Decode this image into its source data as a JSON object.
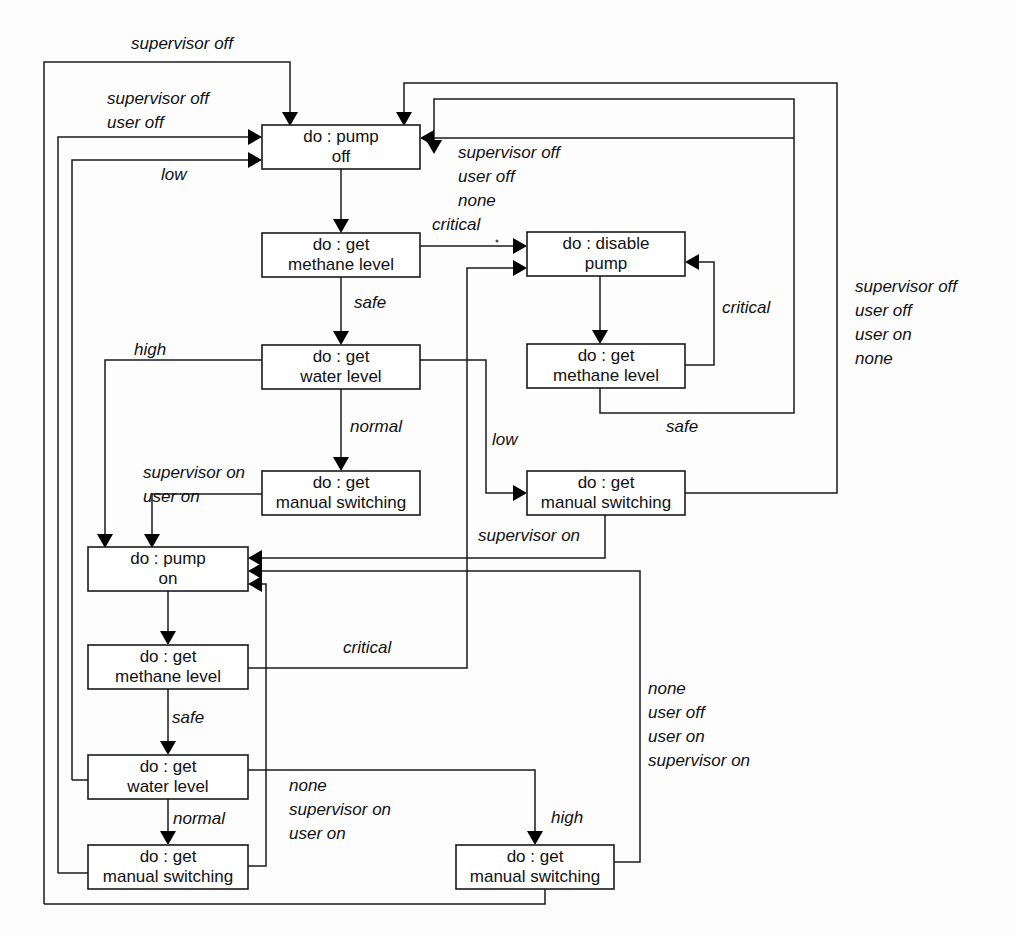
{
  "diagram": {
    "type": "state-machine-diagram",
    "colors": {
      "background": "#fdfdfd",
      "stroke": "#1a1a1a",
      "text": "#111111"
    },
    "states": [
      {
        "id": "pump-off",
        "line1": "do : pump",
        "line2": "off",
        "x": 262,
        "y": 125,
        "w": 158,
        "h": 44
      },
      {
        "id": "methane-off",
        "line1": "do : get",
        "line2": "methane level",
        "x": 262,
        "y": 233,
        "w": 158,
        "h": 44
      },
      {
        "id": "water-off",
        "line1": "do : get",
        "line2": "water level",
        "x": 262,
        "y": 345,
        "w": 158,
        "h": 44
      },
      {
        "id": "manual-off",
        "line1": "do : get",
        "line2": "manual switching",
        "x": 262,
        "y": 471,
        "w": 158,
        "h": 44
      },
      {
        "id": "disable-pump",
        "line1": "do : disable",
        "line2": "pump",
        "x": 527,
        "y": 232,
        "w": 158,
        "h": 44
      },
      {
        "id": "methane-disable",
        "line1": "do : get",
        "line2": "methane level",
        "x": 527,
        "y": 344,
        "w": 158,
        "h": 44
      },
      {
        "id": "manual-low",
        "line1": "do : get",
        "line2": "manual switching",
        "x": 527,
        "y": 471,
        "w": 158,
        "h": 44
      },
      {
        "id": "pump-on",
        "line1": "do : pump",
        "line2": "on",
        "x": 88,
        "y": 547,
        "w": 160,
        "h": 44
      },
      {
        "id": "methane-on",
        "line1": "do : get",
        "line2": "methane level",
        "x": 88,
        "y": 645,
        "w": 160,
        "h": 44
      },
      {
        "id": "water-on",
        "line1": "do : get",
        "line2": "water level",
        "x": 88,
        "y": 755,
        "w": 160,
        "h": 44
      },
      {
        "id": "manual-on",
        "line1": "do : get",
        "line2": "manual switching",
        "x": 88,
        "y": 845,
        "w": 160,
        "h": 44
      },
      {
        "id": "manual-high",
        "line1": "do : get",
        "line2": "manual switching",
        "x": 456,
        "y": 845,
        "w": 158,
        "h": 44
      }
    ],
    "edge_labels": [
      {
        "id": "supervisor-off-top",
        "text": "supervisor off",
        "x": 131,
        "y": 45
      },
      {
        "id": "supervisor-off-2",
        "text": "supervisor off",
        "x": 107,
        "y": 100
      },
      {
        "id": "user-off-2",
        "text": "user off",
        "x": 107,
        "y": 124
      },
      {
        "id": "low-to-off",
        "text": "low",
        "x": 161,
        "y": 176
      },
      {
        "id": "critical-off",
        "text": "critical",
        "x": 432,
        "y": 226
      },
      {
        "id": "supervisor-off-3",
        "text": "supervisor off",
        "x": 458,
        "y": 154
      },
      {
        "id": "user-off-3",
        "text": "user off",
        "x": 458,
        "y": 178
      },
      {
        "id": "none-3",
        "text": "none",
        "x": 458,
        "y": 202
      },
      {
        "id": "safe-off",
        "text": "safe",
        "x": 354,
        "y": 304
      },
      {
        "id": "critical-disable",
        "text": "critical",
        "x": 722,
        "y": 309
      },
      {
        "id": "safe-disable",
        "text": "safe",
        "x": 666,
        "y": 428
      },
      {
        "id": "high-off",
        "text": "high",
        "x": 134,
        "y": 351
      },
      {
        "id": "normal-off",
        "text": "normal",
        "x": 350,
        "y": 428
      },
      {
        "id": "low-right",
        "text": "low",
        "x": 492,
        "y": 441
      },
      {
        "id": "supervisor-on-2",
        "text": "supervisor on",
        "x": 143,
        "y": 474
      },
      {
        "id": "user-on-2",
        "text": "user on",
        "x": 143,
        "y": 498
      },
      {
        "id": "supervisor-on-mid",
        "text": "supervisor on",
        "x": 478,
        "y": 537
      },
      {
        "id": "supervisor-off-right",
        "text": "supervisor off",
        "x": 855,
        "y": 288
      },
      {
        "id": "user-off-right",
        "text": "user off",
        "x": 855,
        "y": 312
      },
      {
        "id": "user-on-right",
        "text": "user on",
        "x": 855,
        "y": 336
      },
      {
        "id": "none-right",
        "text": "none",
        "x": 855,
        "y": 360
      },
      {
        "id": "critical-on",
        "text": "critical",
        "x": 343,
        "y": 649
      },
      {
        "id": "safe-on",
        "text": "safe",
        "x": 172,
        "y": 719
      },
      {
        "id": "normal-on",
        "text": "normal",
        "x": 173,
        "y": 820
      },
      {
        "id": "none-bottom",
        "text": "none",
        "x": 289,
        "y": 787
      },
      {
        "id": "supervisor-on-bottom",
        "text": "supervisor on",
        "x": 289,
        "y": 811
      },
      {
        "id": "user-on-bottom",
        "text": "user on",
        "x": 289,
        "y": 835
      },
      {
        "id": "none-br",
        "text": "none",
        "x": 648,
        "y": 690
      },
      {
        "id": "user-off-br",
        "text": "user off",
        "x": 648,
        "y": 714
      },
      {
        "id": "user-on-br",
        "text": "user on",
        "x": 648,
        "y": 738
      },
      {
        "id": "supervisor-on-br",
        "text": "supervisor on",
        "x": 648,
        "y": 762
      },
      {
        "id": "high-br",
        "text": "high",
        "x": 551,
        "y": 819
      }
    ],
    "transitions": [
      {
        "id": "t-supervisor-off-top",
        "from": "pump-on",
        "to": "pump-off",
        "label": "supervisor off"
      },
      {
        "id": "t-supervisor-off-user-off",
        "from": "manual-on",
        "to": "pump-off",
        "label": "supervisor off / user off"
      },
      {
        "id": "t-low",
        "from": "water-on",
        "to": "pump-off",
        "label": "low"
      },
      {
        "id": "t-off-methane",
        "from": "pump-off",
        "to": "methane-off",
        "label": ""
      },
      {
        "id": "t-critical-off",
        "from": "methane-off",
        "to": "disable-pump",
        "label": "critical"
      },
      {
        "id": "t-safe-off",
        "from": "methane-off",
        "to": "water-off",
        "label": "safe"
      },
      {
        "id": "t-high-off",
        "from": "water-off",
        "to": "pump-on",
        "label": "high"
      },
      {
        "id": "t-normal-off",
        "from": "water-off",
        "to": "manual-off",
        "label": "normal"
      },
      {
        "id": "t-supervisor-on-user-on",
        "from": "manual-off",
        "to": "pump-on",
        "label": "supervisor on / user on"
      },
      {
        "id": "t-disable-methane",
        "from": "disable-pump",
        "to": "methane-disable",
        "label": ""
      },
      {
        "id": "t-critical-disable",
        "from": "methane-disable",
        "to": "disable-pump",
        "label": "critical"
      },
      {
        "id": "t-safe-disable",
        "from": "methane-disable",
        "to": "pump-off",
        "label": "safe"
      },
      {
        "id": "t-low-right",
        "from": "water-on",
        "to": "manual-low",
        "label": "low"
      },
      {
        "id": "t-supervisor-on-mid",
        "from": "manual-low",
        "to": "pump-on",
        "label": "supervisor on"
      },
      {
        "id": "t-right-loop",
        "from": "manual-low",
        "to": "pump-off",
        "label": "supervisor off / user off / user on / none"
      },
      {
        "id": "t-on-methane",
        "from": "pump-on",
        "to": "methane-on",
        "label": ""
      },
      {
        "id": "t-critical-on",
        "from": "methane-on",
        "to": "disable-pump",
        "label": "critical"
      },
      {
        "id": "t-safe-on",
        "from": "methane-on",
        "to": "water-on",
        "label": "safe"
      },
      {
        "id": "t-normal-on",
        "from": "water-on",
        "to": "manual-on",
        "label": "normal"
      },
      {
        "id": "t-high-br",
        "from": "water-on",
        "to": "manual-high",
        "label": "high"
      },
      {
        "id": "t-none-bottom",
        "from": "manual-on",
        "to": "pump-on",
        "label": "none / supervisor on / user on"
      },
      {
        "id": "t-none-br",
        "from": "manual-high",
        "to": "pump-on",
        "label": "none / user off / user on / supervisor on"
      }
    ]
  }
}
